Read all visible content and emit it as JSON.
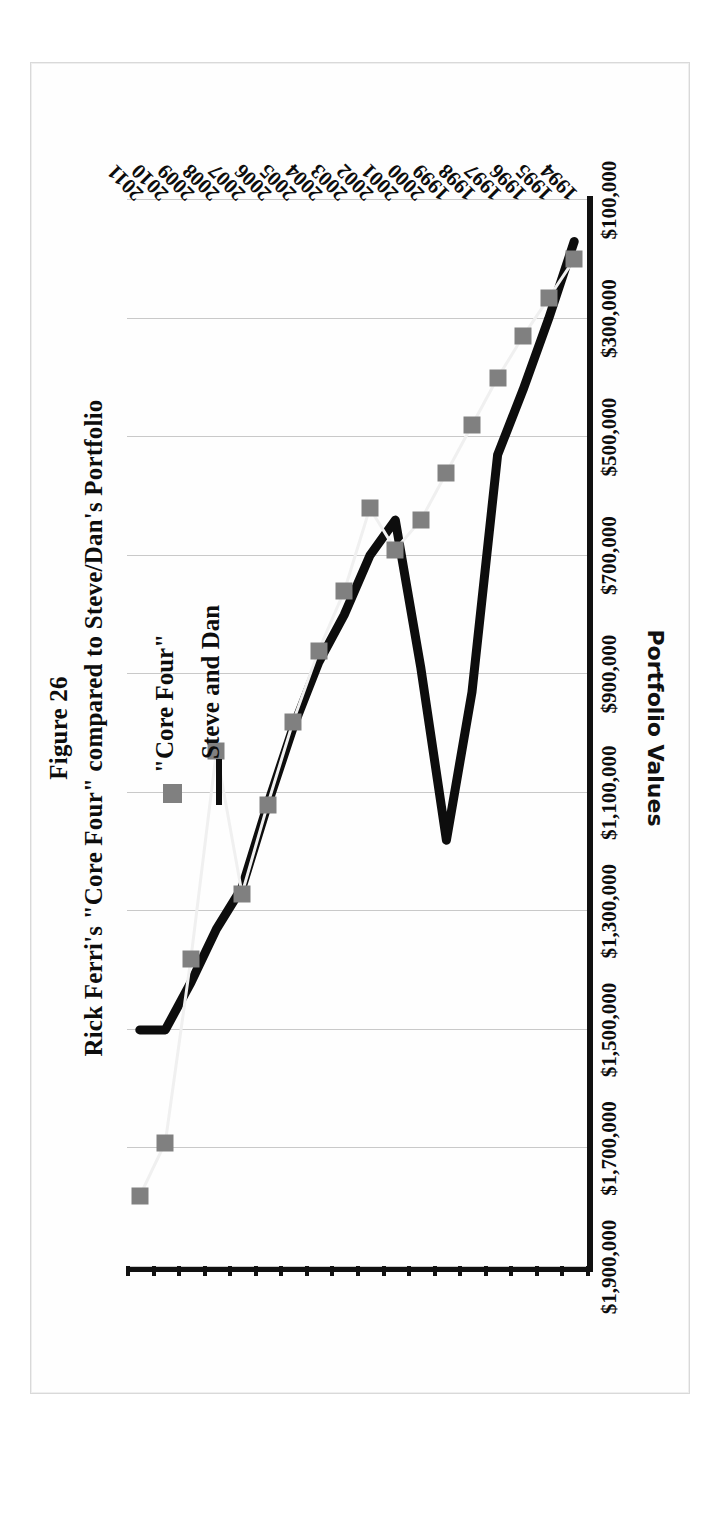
{
  "figure": {
    "title": "Figure 26",
    "subtitle": "Rick Ferri's \"Core Four\" compared to Steve/Dan's Portfolio"
  },
  "legend": {
    "position": "inside-right",
    "items": [
      {
        "label": "\"Core Four\"",
        "marker": "square",
        "color": "#808080"
      },
      {
        "label": "Steve and Dan",
        "marker": "line",
        "color": "#0d0d0d"
      }
    ]
  },
  "axes": {
    "y_title": "Portfolio Values",
    "y_ticks": [
      "$1,900,000",
      "$1,700,000",
      "$1,500,000",
      "$1,300,000",
      "$1,100,000",
      "$900,000",
      "$700,000",
      "$500,000",
      "$300,000",
      "$100,000"
    ],
    "x_ticks": [
      "1994",
      "1995",
      "1996",
      "1997",
      "1998",
      "1999",
      "2000",
      "2001",
      "2002",
      "2003",
      "2004",
      "2005",
      "2006",
      "2007",
      "2008",
      "2009",
      "2010",
      "2011"
    ]
  },
  "chart_data": {
    "type": "line",
    "title": "Rick Ferri's \"Core Four\" compared to Steve/Dan's Portfolio",
    "xlabel": "",
    "ylabel": "Portfolio Values",
    "ylim": [
      100000,
      1900000
    ],
    "ytick_values": [
      1900000,
      1700000,
      1500000,
      1300000,
      1100000,
      900000,
      700000,
      500000,
      300000,
      100000
    ],
    "grid": true,
    "legend_position": "inside-right",
    "categories": [
      "1994",
      "1995",
      "1996",
      "1997",
      "1998",
      "1999",
      "2000",
      "2001",
      "2002",
      "2003",
      "2004",
      "2005",
      "2006",
      "2007",
      "2008",
      "2009",
      "2010",
      "2011"
    ],
    "series": [
      {
        "name": "\"Core Four\"",
        "style": "markers",
        "marker": "square",
        "color": "#808080",
        "values": [
          200000,
          265000,
          330000,
          400000,
          480000,
          560000,
          640000,
          690000,
          620000,
          760000,
          860000,
          980000,
          1120000,
          1270000,
          1030000,
          1380000,
          1690000,
          1780000
        ]
      },
      {
        "name": "Steve and Dan",
        "style": "line",
        "color": "#0d0d0d",
        "values": [
          170000,
          300000,
          420000,
          530000,
          930000,
          1180000,
          890000,
          640000,
          700000,
          800000,
          880000,
          990000,
          1120000,
          1260000,
          1330000,
          1420000,
          1500000,
          1500000
        ]
      }
    ]
  }
}
